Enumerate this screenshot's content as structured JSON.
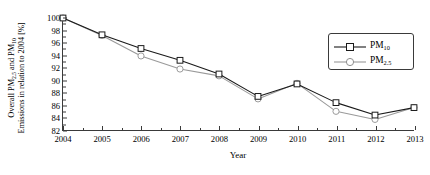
{
  "chart_data": {
    "type": "line",
    "title": "",
    "xlabel": "Year",
    "ylabel_line1": "Overall PM2.5 and PM10",
    "ylabel_line2": "Emissions in relation to 2004 [%]",
    "categories": [
      "2004",
      "2005",
      "2006",
      "2007",
      "2008",
      "2009",
      "2010",
      "2011",
      "2012",
      "2013"
    ],
    "x": [
      2004,
      2005,
      2006,
      2007,
      2008,
      2009,
      2010,
      2011,
      2012,
      2013
    ],
    "xlim": [
      2004,
      2013
    ],
    "ylim": [
      82,
      100
    ],
    "yticks": [
      82,
      84,
      86,
      88,
      90,
      92,
      94,
      96,
      98,
      100
    ],
    "ytick_labels": [
      "82",
      "84",
      "86",
      "88",
      "90",
      "92",
      "94",
      "96",
      "98",
      "100"
    ],
    "grid": false,
    "legend_position": "upper right",
    "series": [
      {
        "name": "PM10",
        "values": [
          100.0,
          97.3,
          95.1,
          93.2,
          91.0,
          87.4,
          89.4,
          86.4,
          84.4,
          85.6
        ],
        "color": "#1a1a1a",
        "marker": "square"
      },
      {
        "name": "PM2.5",
        "values": [
          100.0,
          97.2,
          93.9,
          91.8,
          90.7,
          87.0,
          89.5,
          85.0,
          83.7,
          85.6
        ],
        "color": "#9a9a9a",
        "marker": "circle"
      }
    ]
  },
  "legend": {
    "items": [
      {
        "label_base": "PM",
        "label_sub": "10"
      },
      {
        "label_base": "PM",
        "label_sub": "2.5"
      }
    ]
  },
  "axis": {
    "x_title": "Year"
  },
  "colors": {
    "pm10": "#1a1a1a",
    "pm25": "#9a9a9a",
    "axis": "#3a3a3a",
    "background": "#ffffff"
  }
}
